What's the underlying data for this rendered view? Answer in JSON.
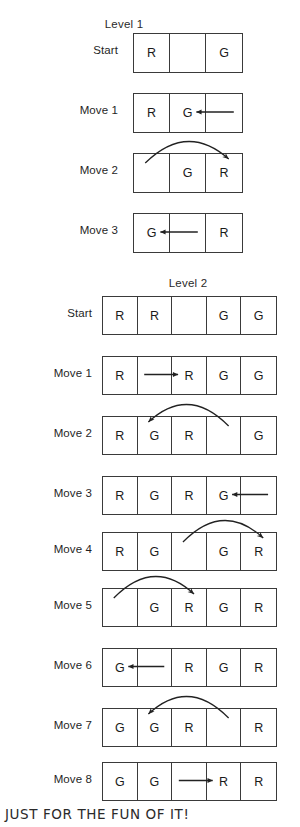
{
  "footer": {
    "note": "JUST FOR THE FUN OF IT!"
  },
  "tokens": {
    "red": "R",
    "green": "G",
    "empty": ""
  },
  "levels": [
    {
      "title": "Level 1",
      "cells": 3,
      "rows": [
        {
          "label": "Start",
          "board": [
            "R",
            "",
            "G"
          ],
          "arrow": null
        },
        {
          "label": "Move 1",
          "board": [
            "R",
            "G",
            ""
          ],
          "arrow": {
            "type": "straight",
            "direction": "left",
            "from_cell": 3,
            "to_cell": 2
          }
        },
        {
          "label": "Move 2",
          "board": [
            "",
            "G",
            "R"
          ],
          "arrow": {
            "type": "arc",
            "direction": "right",
            "from_cell": 1,
            "to_cell": 3
          }
        },
        {
          "label": "Move 3",
          "board": [
            "G",
            "",
            "R"
          ],
          "arrow": {
            "type": "straight",
            "direction": "left",
            "from_cell": 2,
            "to_cell": 1
          }
        }
      ]
    },
    {
      "title": "Level 2",
      "cells": 5,
      "rows": [
        {
          "label": "Start",
          "board": [
            "R",
            "R",
            "",
            "G",
            "G"
          ],
          "arrow": null
        },
        {
          "label": "Move 1",
          "board": [
            "R",
            "",
            "R",
            "G",
            "G"
          ],
          "arrow": {
            "type": "straight",
            "direction": "right",
            "from_cell": 2,
            "to_cell": 3
          }
        },
        {
          "label": "Move 2",
          "board": [
            "R",
            "G",
            "R",
            "",
            "G"
          ],
          "arrow": {
            "type": "arc",
            "direction": "left",
            "from_cell": 4,
            "to_cell": 2
          }
        },
        {
          "label": "Move 3",
          "board": [
            "R",
            "G",
            "R",
            "G",
            ""
          ],
          "arrow": {
            "type": "straight",
            "direction": "left",
            "from_cell": 5,
            "to_cell": 4
          }
        },
        {
          "label": "Move 4",
          "board": [
            "R",
            "G",
            "",
            "G",
            "R"
          ],
          "arrow": {
            "type": "arc",
            "direction": "right",
            "from_cell": 3,
            "to_cell": 5
          }
        },
        {
          "label": "Move 5",
          "board": [
            "",
            "G",
            "R",
            "G",
            "R"
          ],
          "arrow": {
            "type": "arc",
            "direction": "right",
            "from_cell": 1,
            "to_cell": 3
          }
        },
        {
          "label": "Move 6",
          "board": [
            "G",
            "",
            "R",
            "G",
            "R"
          ],
          "arrow": {
            "type": "straight",
            "direction": "left",
            "from_cell": 2,
            "to_cell": 1
          }
        },
        {
          "label": "Move 7",
          "board": [
            "G",
            "G",
            "R",
            "",
            "R"
          ],
          "arrow": {
            "type": "arc",
            "direction": "left",
            "from_cell": 4,
            "to_cell": 2
          }
        },
        {
          "label": "Move 8",
          "board": [
            "G",
            "G",
            "",
            "R",
            "R"
          ],
          "arrow": {
            "type": "straight",
            "direction": "right",
            "from_cell": 3,
            "to_cell": 4
          }
        }
      ]
    }
  ],
  "geometry": {
    "level1": {
      "grid_left": 133,
      "cell_w": 36,
      "cell_h": 38,
      "label_right": 118,
      "row_tops": [
        33,
        93,
        153,
        213
      ]
    },
    "level2": {
      "grid_left": 102,
      "cell_w": 34.6,
      "cell_h": 37,
      "label_right": 92,
      "row_tops": [
        296,
        356,
        416,
        476,
        532,
        588,
        648,
        708,
        762
      ]
    }
  },
  "colors": {
    "stroke": "#3a3a3a",
    "text": "#1a1a1a",
    "arrow": "#222222",
    "background": "#ffffff"
  }
}
